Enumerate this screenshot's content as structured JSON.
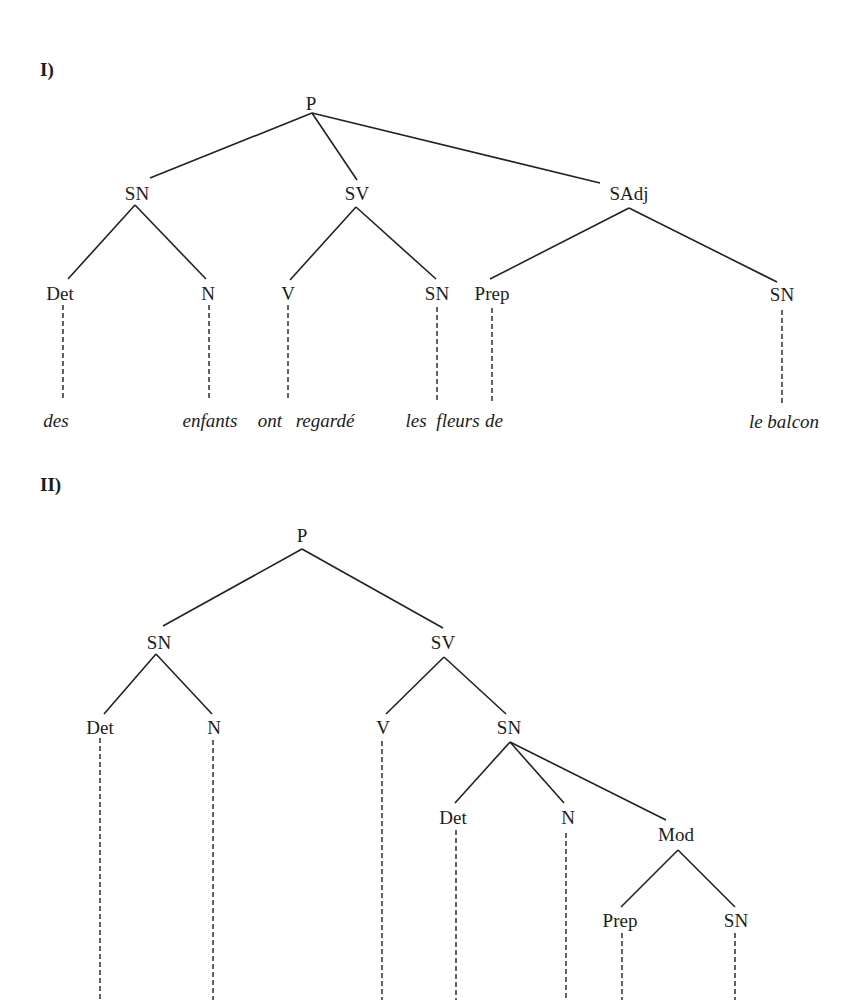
{
  "trees": [
    {
      "id": "I",
      "section_label": "I)",
      "section_pos": [
        40,
        60
      ],
      "nodes": [
        {
          "id": "P",
          "label": "P",
          "x": 311,
          "y": 103
        },
        {
          "id": "SN1",
          "label": "SN",
          "x": 137,
          "y": 193
        },
        {
          "id": "SV",
          "label": "SV",
          "x": 357,
          "y": 193
        },
        {
          "id": "SAdj",
          "label": "SAdj",
          "x": 629,
          "y": 193
        },
        {
          "id": "Det",
          "label": "Det",
          "x": 60,
          "y": 293
        },
        {
          "id": "N",
          "label": "N",
          "x": 208,
          "y": 293
        },
        {
          "id": "V",
          "label": "V",
          "x": 288,
          "y": 293
        },
        {
          "id": "SN2",
          "label": "SN",
          "x": 437,
          "y": 293
        },
        {
          "id": "Prep",
          "label": "Prep",
          "x": 492,
          "y": 293
        },
        {
          "id": "SN3",
          "label": "SN",
          "x": 782,
          "y": 294
        }
      ],
      "edges": [
        [
          "P",
          "SN1",
          312,
          113,
          150,
          178
        ],
        [
          "P",
          "SV",
          312,
          113,
          357,
          180
        ],
        [
          "P",
          "SAdj",
          312,
          113,
          600,
          183
        ],
        [
          "SN1",
          "Det",
          135,
          205,
          68,
          279
        ],
        [
          "SN1",
          "N",
          135,
          205,
          206,
          279
        ],
        [
          "SV",
          "V",
          356,
          207,
          290,
          280
        ],
        [
          "SV",
          "SN2",
          356,
          207,
          436,
          279
        ],
        [
          "SAdj",
          "Prep",
          629,
          208,
          490,
          279
        ],
        [
          "SAdj",
          "SN3",
          629,
          208,
          777,
          282
        ]
      ],
      "dashes": [
        [
          63,
          305,
          63,
          398
        ],
        [
          209,
          305,
          209,
          398
        ],
        [
          288,
          305,
          288,
          398
        ],
        [
          437,
          307,
          437,
          402
        ],
        [
          492,
          308,
          492,
          402
        ],
        [
          782,
          310,
          782,
          404
        ]
      ],
      "words": [
        {
          "text": "des",
          "x": 56,
          "y": 420
        },
        {
          "text": "enfants",
          "x": 210,
          "y": 420
        },
        {
          "text": "ont",
          "x": 270,
          "y": 420
        },
        {
          "text": "regardé",
          "x": 325,
          "y": 420
        },
        {
          "text": "les",
          "x": 416,
          "y": 420
        },
        {
          "text": "fleurs",
          "x": 458,
          "y": 420
        },
        {
          "text": "de",
          "x": 494,
          "y": 420
        },
        {
          "text": "le balcon",
          "x": 784,
          "y": 421
        }
      ]
    },
    {
      "id": "II",
      "section_label": "II)",
      "section_pos": [
        40,
        475
      ],
      "nodes": [
        {
          "id": "P",
          "label": "P",
          "x": 302,
          "y": 535
        },
        {
          "id": "SN1",
          "label": "SN",
          "x": 159,
          "y": 642
        },
        {
          "id": "SV",
          "label": "SV",
          "x": 443,
          "y": 642
        },
        {
          "id": "Det1",
          "label": "Det",
          "x": 100,
          "y": 727
        },
        {
          "id": "N1",
          "label": "N",
          "x": 214,
          "y": 727
        },
        {
          "id": "V",
          "label": "V",
          "x": 383,
          "y": 727
        },
        {
          "id": "SN2",
          "label": "SN",
          "x": 509,
          "y": 727
        },
        {
          "id": "Det2",
          "label": "Det",
          "x": 453,
          "y": 817
        },
        {
          "id": "N2",
          "label": "N",
          "x": 568,
          "y": 817
        },
        {
          "id": "Mod",
          "label": "Mod",
          "x": 676,
          "y": 834
        },
        {
          "id": "Prep",
          "label": "Prep",
          "x": 620,
          "y": 920
        },
        {
          "id": "SN3",
          "label": "SN",
          "x": 736,
          "y": 920
        }
      ],
      "edges": [
        [
          "P",
          "SN1",
          302,
          549,
          163,
          626
        ],
        [
          "P",
          "SV",
          302,
          549,
          443,
          628
        ],
        [
          "SN1",
          "Det1",
          156,
          654,
          104,
          714
        ],
        [
          "SN1",
          "N1",
          156,
          654,
          212,
          714
        ],
        [
          "SV",
          "V",
          444,
          657,
          386,
          714
        ],
        [
          "SV",
          "SN2",
          444,
          657,
          506,
          714
        ],
        [
          "SN2",
          "Det2",
          510,
          742,
          455,
          803
        ],
        [
          "SN2",
          "N2",
          510,
          742,
          564,
          803
        ],
        [
          "SN2",
          "Mod",
          510,
          742,
          666,
          820
        ],
        [
          "Mod",
          "Prep",
          678,
          850,
          621,
          907
        ],
        [
          "Mod",
          "SN3",
          678,
          850,
          735,
          907
        ]
      ],
      "dashes": [
        [
          100,
          738,
          100,
          1000
        ],
        [
          213,
          740,
          213,
          1000
        ],
        [
          382,
          741,
          382,
          1000
        ],
        [
          456,
          830,
          456,
          1000
        ],
        [
          566,
          833,
          566,
          1000
        ],
        [
          622,
          933,
          622,
          1000
        ],
        [
          735,
          933,
          735,
          1000
        ]
      ],
      "words": []
    }
  ]
}
